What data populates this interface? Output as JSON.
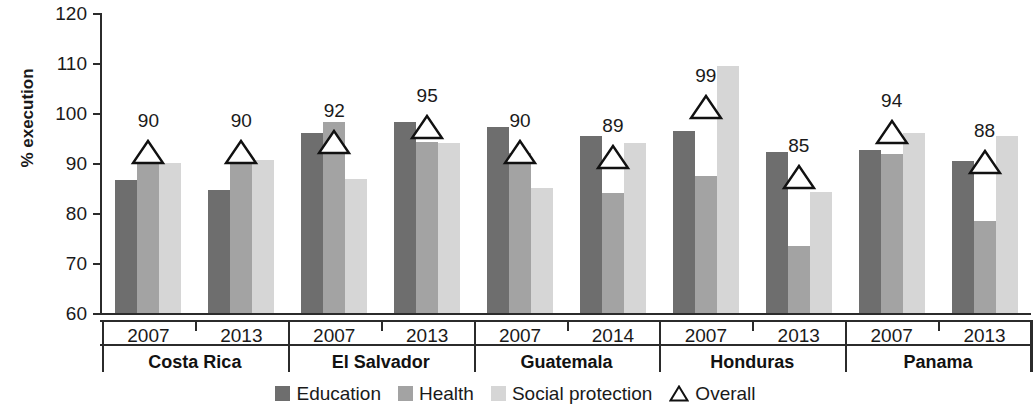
{
  "chart_data": {
    "type": "bar",
    "title": "",
    "subtitle": "",
    "xlabel": "",
    "ylabel": "% execution",
    "ylim": [
      60,
      120
    ],
    "ytick_labels": [
      "120",
      "110",
      "100",
      "90",
      "80",
      "70",
      "60"
    ],
    "yticks": [
      120,
      110,
      100,
      90,
      80,
      70,
      60
    ],
    "grid": false,
    "legend_position": "bottom",
    "legend": [
      {
        "name": "Education",
        "marker": "square",
        "color": "#6e6e6e"
      },
      {
        "name": "Health",
        "marker": "square",
        "color": "#a3a3a3"
      },
      {
        "name": "Social protection",
        "marker": "square",
        "color": "#d6d6d6"
      },
      {
        "name": "Overall",
        "marker": "triangle-open",
        "color": "#ffffff"
      }
    ],
    "series": [
      {
        "name": "Education",
        "values": [
          86.7,
          84.6,
          96.0,
          98.3,
          97.2,
          95.4,
          96.5,
          92.3,
          92.6,
          90.4
        ]
      },
      {
        "name": "Health",
        "values": [
          90.2,
          90.8,
          98.2,
          94.3,
          92.1,
          84.0,
          87.4,
          73.4,
          91.9,
          78.5
        ]
      },
      {
        "name": "Social protection",
        "values": [
          90.0,
          90.7,
          86.8,
          94.1,
          85.1,
          94.1,
          109.5,
          84.3,
          96.0,
          95.4
        ]
      },
      {
        "name": "Overall",
        "values": [
          90,
          90,
          92,
          95,
          90,
          89,
          99,
          85,
          94,
          88
        ]
      }
    ],
    "overall_labels": [
      "90",
      "90",
      "92",
      "95",
      "90",
      "89",
      "99",
      "85",
      "94",
      "88"
    ],
    "x": [
      {
        "year": "2007",
        "country": "Costa Rica"
      },
      {
        "year": "2013",
        "country": "Costa Rica"
      },
      {
        "year": "2007",
        "country": "El Salvador"
      },
      {
        "year": "2013",
        "country": "El Salvador"
      },
      {
        "year": "2007",
        "country": "Guatemala"
      },
      {
        "year": "2014",
        "country": "Guatemala"
      },
      {
        "year": "2007",
        "country": "Honduras"
      },
      {
        "year": "2013",
        "country": "Honduras"
      },
      {
        "year": "2007",
        "country": "Panama"
      },
      {
        "year": "2013",
        "country": "Panama"
      }
    ],
    "countries": [
      "Costa Rica",
      "El Salvador",
      "Guatemala",
      "Honduras",
      "Panama"
    ],
    "year_labels": [
      "2007",
      "2013",
      "2007",
      "2013",
      "2007",
      "2014",
      "2007",
      "2013",
      "2007",
      "2013"
    ],
    "colors": {
      "education": "#6e6e6e",
      "health": "#a3a3a3",
      "social_protection": "#d6d6d6",
      "axis": "#2b2b2b",
      "text": "#1a1a1a"
    }
  }
}
